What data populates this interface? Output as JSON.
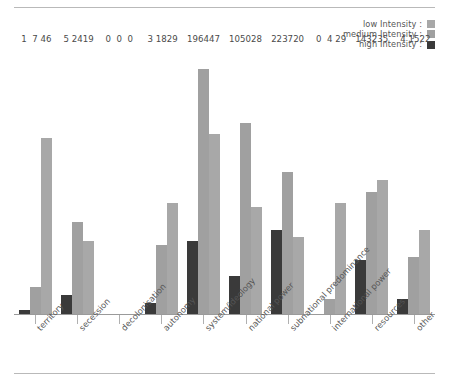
{
  "legend": {
    "items": [
      {
        "label": "low Intensity :",
        "color": "#a8a8a8",
        "key": "low"
      },
      {
        "label": "medium Intensity :",
        "color": "#a0a0a0",
        "key": "medium"
      },
      {
        "label": "high Intensity :",
        "color": "#3a3a3a",
        "key": "high"
      }
    ]
  },
  "chart_data": {
    "type": "bar",
    "title": "",
    "xlabel": "",
    "ylabel": "",
    "ylim": [
      0,
      70
    ],
    "grid": false,
    "legend_position": "top-right",
    "bar_order_in_group": [
      "high",
      "medium",
      "low"
    ],
    "categories": [
      "territory",
      "secession",
      "decolonisation",
      "autonomy",
      "system/ideology",
      "national power",
      "subnational predominance",
      "international power",
      "resources",
      "other"
    ],
    "series": [
      {
        "name": "high Intensity",
        "color": "#3a3a3a",
        "values": [
          1,
          5,
          0,
          3,
          19,
          10,
          22,
          0,
          14,
          4
        ]
      },
      {
        "name": "medium Intensity",
        "color": "#a0a0a0",
        "values": [
          7,
          24,
          0,
          18,
          64,
          50,
          37,
          4,
          32,
          15
        ]
      },
      {
        "name": "low Intensity",
        "color": "#a8a8a8",
        "values": [
          46,
          19,
          0,
          29,
          47,
          28,
          20,
          29,
          35,
          22
        ]
      }
    ]
  }
}
